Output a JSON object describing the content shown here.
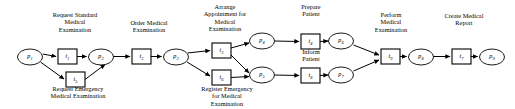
{
  "diagram": {
    "type": "petri-net",
    "width": 515,
    "height": 109,
    "colors": {
      "background": "#ffffff",
      "stroke": "#000000",
      "node_fill": "#ffffff"
    },
    "places": [
      {
        "id": "p1",
        "label": "p",
        "sub": "1",
        "cx": 30,
        "cy": 57,
        "rx": 12.5,
        "ry": 8.0
      },
      {
        "id": "p2",
        "label": "p",
        "sub": "2",
        "cx": 101,
        "cy": 57,
        "rx": 12.5,
        "ry": 8.0
      },
      {
        "id": "p3",
        "label": "p",
        "sub": "3",
        "cx": 176,
        "cy": 57,
        "rx": 12.5,
        "ry": 8.0
      },
      {
        "id": "p4",
        "label": "p",
        "sub": "4",
        "cx": 262,
        "cy": 41,
        "rx": 12.5,
        "ry": 8.0
      },
      {
        "id": "p5",
        "label": "p",
        "sub": "5",
        "cx": 262,
        "cy": 75,
        "rx": 12.5,
        "ry": 8.0
      },
      {
        "id": "p6",
        "label": "p",
        "sub": "6",
        "cx": 341,
        "cy": 41,
        "rx": 12.5,
        "ry": 8.0
      },
      {
        "id": "p7",
        "label": "p",
        "sub": "7",
        "cx": 341,
        "cy": 75,
        "rx": 12.5,
        "ry": 8.0
      },
      {
        "id": "p8",
        "label": "p",
        "sub": "8",
        "cx": 421,
        "cy": 57,
        "rx": 12.5,
        "ry": 8.0
      },
      {
        "id": "p9",
        "label": "p",
        "sub": "9",
        "cx": 492,
        "cy": 57,
        "rx": 12.5,
        "ry": 8.0
      }
    ],
    "transitions": [
      {
        "id": "t1",
        "label": "t",
        "sub": "1",
        "x": 58,
        "y": 49,
        "w": 19,
        "h": 15
      },
      {
        "id": "t5",
        "label": "t",
        "sub": "5",
        "x": 66,
        "y": 72,
        "w": 19,
        "h": 15
      },
      {
        "id": "t2",
        "label": "t",
        "sub": "2",
        "x": 132,
        "y": 49,
        "w": 19,
        "h": 15
      },
      {
        "id": "t3",
        "label": "t",
        "sub": "3",
        "x": 212,
        "y": 43,
        "w": 19,
        "h": 15
      },
      {
        "id": "t6",
        "label": "t",
        "sub": "6",
        "x": 212,
        "y": 70,
        "w": 19,
        "h": 15
      },
      {
        "id": "t4",
        "label": "t",
        "sub": "4",
        "x": 301,
        "y": 34,
        "w": 19,
        "h": 15
      },
      {
        "id": "t8",
        "label": "t",
        "sub": "8",
        "x": 301,
        "y": 68,
        "w": 19,
        "h": 15
      },
      {
        "id": "t9",
        "label": "t",
        "sub": "9",
        "x": 381,
        "y": 49,
        "w": 19,
        "h": 15
      },
      {
        "id": "t7",
        "label": "t",
        "sub": "7",
        "x": 452,
        "y": 49,
        "w": 19,
        "h": 15
      }
    ],
    "captions": [
      {
        "id": "cap-request-standard",
        "text": "Request Standard\nMedical\nExamination",
        "x": 33,
        "y": 11,
        "w": 84,
        "align": "center"
      },
      {
        "id": "cap-request-emergency",
        "text": "Request Emergency\nMedical Examination",
        "x": 22,
        "y": 85,
        "w": 112,
        "align": "center"
      },
      {
        "id": "cap-order-medical",
        "text": "Order Medical\nExamination",
        "x": 112,
        "y": 19,
        "w": 74,
        "align": "center"
      },
      {
        "id": "cap-arrange",
        "text": "Arrange\nAppointment for\nMedical\nExamination",
        "x": 186,
        "y": 3,
        "w": 78,
        "align": "center"
      },
      {
        "id": "cap-register-emergency",
        "text": "Register Emergency\nfor Medical\nExamination",
        "x": 177,
        "y": 85,
        "w": 100,
        "align": "center"
      },
      {
        "id": "cap-prepare-patient",
        "text": "Prepare\nPatient",
        "x": 281,
        "y": 3,
        "w": 60,
        "align": "center"
      },
      {
        "id": "cap-inform-patient",
        "text": "Inform\nPatient",
        "x": 281,
        "y": 48,
        "w": 60,
        "align": "center"
      },
      {
        "id": "cap-perform-medical",
        "text": "Perform\nMedical\nExamination",
        "x": 352,
        "y": 11,
        "w": 78,
        "align": "center"
      },
      {
        "id": "cap-create-report",
        "text": "Create Medical\nReport",
        "x": 424,
        "y": 12,
        "w": 80,
        "align": "center"
      }
    ],
    "arcs": [
      {
        "id": "arc-p1-t1",
        "from": "p1",
        "to": "t1",
        "path": "M 42.8 54 L 56 56.5"
      },
      {
        "id": "arc-t1-p2",
        "from": "t1",
        "to": "p2",
        "path": "M 77 56.5 L 86.5 56.5"
      },
      {
        "id": "arc-p1-t5",
        "from": "p1",
        "to": "t5",
        "path": "M 40.5 62 L 64 79"
      },
      {
        "id": "arc-t5-p2",
        "from": "t5",
        "to": "p2",
        "path": "M 85 79.5 L 105 64.5"
      },
      {
        "id": "arc-p2-t2",
        "from": "p2",
        "to": "t2",
        "path": "M 113.5 56.5 L 130 56.5"
      },
      {
        "id": "arc-t2-p3",
        "from": "t2",
        "to": "p3",
        "path": "M 151 56.5 L 161.5 56.5"
      },
      {
        "id": "arc-p3-t3",
        "from": "p3",
        "to": "t3",
        "path": "M 187.5 53 L 210 50.5"
      },
      {
        "id": "arc-p3-t6",
        "from": "p3",
        "to": "t6",
        "path": "M 187 62 L 210 76"
      },
      {
        "id": "arc-t3-p4",
        "from": "t3",
        "to": "p4",
        "path": "M 231 48 L 249 43"
      },
      {
        "id": "arc-t3-p5",
        "from": "t3",
        "to": "p5",
        "path": "M 231 55 L 249 73"
      },
      {
        "id": "arc-t6-p5",
        "from": "t6",
        "to": "p5",
        "path": "M 231 77.5 L 249 76.5"
      },
      {
        "id": "arc-p4-t4",
        "from": "p4",
        "to": "t4",
        "path": "M 274.5 41 L 299 41.5"
      },
      {
        "id": "arc-t4-p6",
        "from": "t4",
        "to": "p6",
        "path": "M 320 41.5 L 328 41"
      },
      {
        "id": "arc-p5-t8",
        "from": "p5",
        "to": "t8",
        "path": "M 274.5 75 L 299 75.5"
      },
      {
        "id": "arc-t8-p7",
        "from": "t8",
        "to": "p7",
        "path": "M 320 75.5 L 328 75"
      },
      {
        "id": "arc-p6-t9",
        "from": "p6",
        "to": "t9",
        "path": "M 353.5 45 L 379 55"
      },
      {
        "id": "arc-p7-t9",
        "from": "p7",
        "to": "t9",
        "path": "M 353.5 71 L 379 60"
      },
      {
        "id": "arc-t9-p8",
        "from": "t9",
        "to": "p8",
        "path": "M 400 56.5 L 406.5 56.5"
      },
      {
        "id": "arc-p8-t7",
        "from": "p8",
        "to": "t7",
        "path": "M 433.5 56.5 L 450 56.5"
      },
      {
        "id": "arc-t7-p9",
        "from": "t7",
        "to": "p9",
        "path": "M 471 56.5 L 477.5 56.5"
      }
    ]
  }
}
